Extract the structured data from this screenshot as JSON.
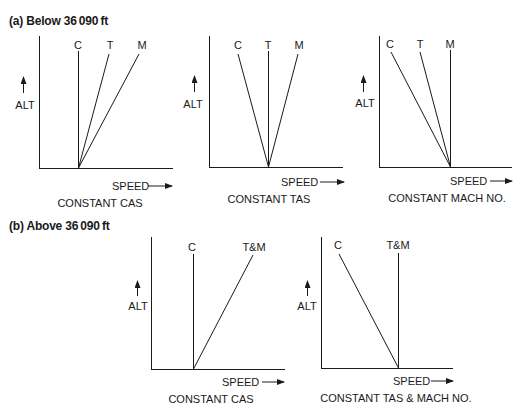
{
  "sections": [
    {
      "title": "(a) Below 36 090 ft",
      "panels": [
        {
          "caption": "CONSTANT CAS",
          "y_label": "ALT",
          "x_label": "SPEED",
          "lines": [
            {
              "label": "C",
              "slope": "vertical"
            },
            {
              "label": "T",
              "slope": "right"
            },
            {
              "label": "M",
              "slope": "right-more"
            }
          ]
        },
        {
          "caption": "CONSTANT TAS",
          "y_label": "ALT",
          "x_label": "SPEED",
          "lines": [
            {
              "label": "C",
              "slope": "left"
            },
            {
              "label": "T",
              "slope": "vertical"
            },
            {
              "label": "M",
              "slope": "right"
            }
          ]
        },
        {
          "caption": "CONSTANT MACH NO.",
          "y_label": "ALT",
          "x_label": "SPEED",
          "lines": [
            {
              "label": "C",
              "slope": "left-more"
            },
            {
              "label": "T",
              "slope": "left"
            },
            {
              "label": "M",
              "slope": "vertical"
            }
          ]
        }
      ]
    },
    {
      "title": "(b) Above 36 090 ft",
      "panels": [
        {
          "caption": "CONSTANT CAS",
          "y_label": "ALT",
          "x_label": "SPEED",
          "lines": [
            {
              "label": "C",
              "slope": "vertical"
            },
            {
              "label": "T&M",
              "slope": "right"
            }
          ]
        },
        {
          "caption": "CONSTANT TAS & MACH NO.",
          "y_label": "ALT",
          "x_label": "SPEED",
          "lines": [
            {
              "label": "C",
              "slope": "left"
            },
            {
              "label": "T&M",
              "slope": "vertical"
            }
          ]
        }
      ]
    }
  ],
  "colors": {
    "ink": "#1a1a1a",
    "background": "#ffffff"
  }
}
